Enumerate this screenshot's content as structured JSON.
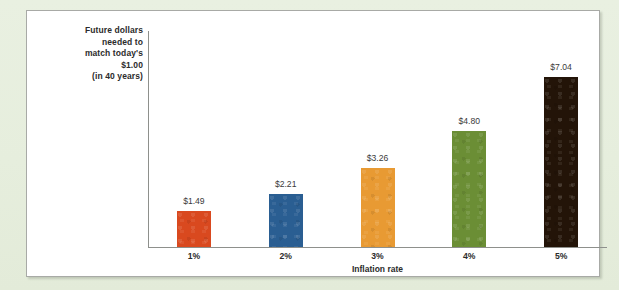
{
  "colors": {
    "mat_background": "#e9f0e1",
    "panel_background": "#ffffff",
    "panel_border": "#a8aaa6",
    "axis_line": "#8e908c",
    "text": "#2b2b2b",
    "data_label_text": "#3a3a3a"
  },
  "chart_data": {
    "type": "bar",
    "title": "",
    "xlabel": "Inflation rate",
    "ylabel": "Future dollars needed to match today's $1.00 (in 40 years)",
    "ylabel_lines": [
      "Future dollars",
      "needed to",
      "match today's",
      "$1.00",
      "(in 40 years)"
    ],
    "categories": [
      "1%",
      "2%",
      "3%",
      "4%",
      "5%"
    ],
    "values": [
      1.49,
      2.21,
      3.26,
      4.8,
      7.04
    ],
    "data_labels": [
      "$1.49",
      "$2.21",
      "$3.26",
      "$4.80",
      "$7.04"
    ],
    "bar_colors": [
      "#d9491f",
      "#2a5e92",
      "#e89a33",
      "#6b8e35",
      "#231408"
    ],
    "ylim": [
      0,
      9
    ],
    "grid": false,
    "legend": false,
    "legend_position": "none",
    "axis_visible": {
      "x": true,
      "y": true
    },
    "value_prefix": "$",
    "value_decimals": 2
  }
}
